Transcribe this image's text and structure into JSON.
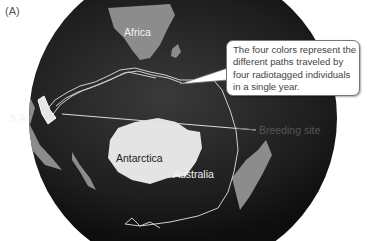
{
  "figure": {
    "panel_label": "(A)",
    "callout": {
      "lines": [
        "The four colors represent the",
        "different paths traveled by",
        "four radiotagged individuals",
        "in a single year."
      ]
    },
    "annotation": {
      "breeding_site": "Breeding site"
    },
    "map_labels": {
      "africa": "Africa",
      "south_america": "S.A.",
      "antarctica": "Antarctica",
      "australia": "Australia"
    },
    "colors": {
      "ocean": "#1c1c1c",
      "land": "#9a9a9a",
      "ice": "#e6e6e6",
      "track": "#d0d0d0",
      "text": "#444444"
    }
  }
}
